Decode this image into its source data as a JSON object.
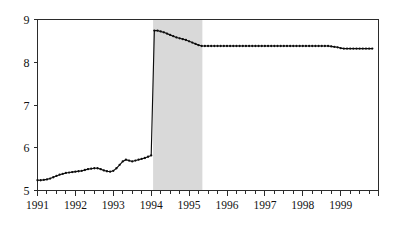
{
  "chart_data": {
    "type": "line",
    "title": "",
    "subtitle": "",
    "xlabel": "",
    "ylabel": "",
    "xlim": [
      1991.0,
      1999.9
    ],
    "ylim": [
      5,
      9
    ],
    "yticks": [
      5,
      6,
      7,
      8,
      9
    ],
    "ytick_labels": [
      "5",
      "6",
      "7",
      "8",
      "9"
    ],
    "xticks": [
      1991,
      1992,
      1993,
      1994,
      1995,
      1996,
      1997,
      1998,
      1999
    ],
    "xtick_labels": [
      "1991",
      "1992",
      "1993",
      "1994",
      "1995",
      "1996",
      "1997",
      "1998",
      "1999"
    ],
    "minor_xticks_per_year": 4,
    "grid": false,
    "legend": null,
    "markers": "filled-circle",
    "line_color": "#0d0d0d",
    "annotations": [
      {
        "kind": "shaded-band",
        "axis": "x",
        "x_start": 1994.05,
        "x_end": 1995.35,
        "color": "#d9d9d9",
        "label": ""
      }
    ],
    "series": [
      {
        "name": "series-1",
        "x": [
          1991.0,
          1991.083,
          1991.167,
          1991.25,
          1991.333,
          1991.417,
          1991.5,
          1991.583,
          1991.667,
          1991.75,
          1991.833,
          1991.917,
          1992.0,
          1992.083,
          1992.167,
          1992.25,
          1992.333,
          1992.417,
          1992.5,
          1992.583,
          1992.667,
          1992.75,
          1992.833,
          1992.917,
          1993.0,
          1993.083,
          1993.167,
          1993.25,
          1993.333,
          1993.417,
          1993.5,
          1993.583,
          1993.667,
          1993.75,
          1993.833,
          1993.917,
          1994.0,
          1994.083,
          1994.167,
          1994.25,
          1994.333,
          1994.417,
          1994.5,
          1994.583,
          1994.667,
          1994.75,
          1994.833,
          1994.917,
          1995.0,
          1995.083,
          1995.167,
          1995.25,
          1995.333,
          1995.417,
          1995.5,
          1995.583,
          1995.667,
          1995.75,
          1995.833,
          1995.917,
          1996.0,
          1996.083,
          1996.167,
          1996.25,
          1996.333,
          1996.417,
          1996.5,
          1996.583,
          1996.667,
          1996.75,
          1996.833,
          1996.917,
          1997.0,
          1997.083,
          1997.167,
          1997.25,
          1997.333,
          1997.417,
          1997.5,
          1997.583,
          1997.667,
          1997.75,
          1997.833,
          1997.917,
          1998.0,
          1998.083,
          1998.167,
          1998.25,
          1998.333,
          1998.417,
          1998.5,
          1998.583,
          1998.667,
          1998.75,
          1998.833,
          1998.917,
          1999.0,
          1999.083,
          1999.167,
          1999.25,
          1999.333,
          1999.417,
          1999.5,
          1999.583,
          1999.667,
          1999.75,
          1999.833
        ],
        "y": [
          5.24,
          5.24,
          5.25,
          5.26,
          5.28,
          5.31,
          5.34,
          5.37,
          5.39,
          5.41,
          5.42,
          5.43,
          5.44,
          5.45,
          5.46,
          5.48,
          5.5,
          5.51,
          5.52,
          5.52,
          5.5,
          5.47,
          5.45,
          5.44,
          5.46,
          5.52,
          5.6,
          5.68,
          5.72,
          5.7,
          5.68,
          5.7,
          5.72,
          5.74,
          5.76,
          5.79,
          5.82,
          8.74,
          8.74,
          8.72,
          8.7,
          8.67,
          8.64,
          8.61,
          8.58,
          8.56,
          8.54,
          8.52,
          8.49,
          8.46,
          8.43,
          8.4,
          8.38,
          8.38,
          8.38,
          8.38,
          8.38,
          8.38,
          8.38,
          8.38,
          8.38,
          8.38,
          8.38,
          8.38,
          8.38,
          8.38,
          8.38,
          8.38,
          8.38,
          8.38,
          8.38,
          8.38,
          8.38,
          8.38,
          8.38,
          8.38,
          8.38,
          8.38,
          8.38,
          8.38,
          8.38,
          8.38,
          8.38,
          8.38,
          8.38,
          8.38,
          8.38,
          8.38,
          8.38,
          8.38,
          8.38,
          8.38,
          8.38,
          8.37,
          8.36,
          8.35,
          8.33,
          8.32,
          8.32,
          8.32,
          8.32,
          8.32,
          8.32,
          8.32,
          8.32,
          8.32,
          8.32
        ]
      }
    ]
  }
}
